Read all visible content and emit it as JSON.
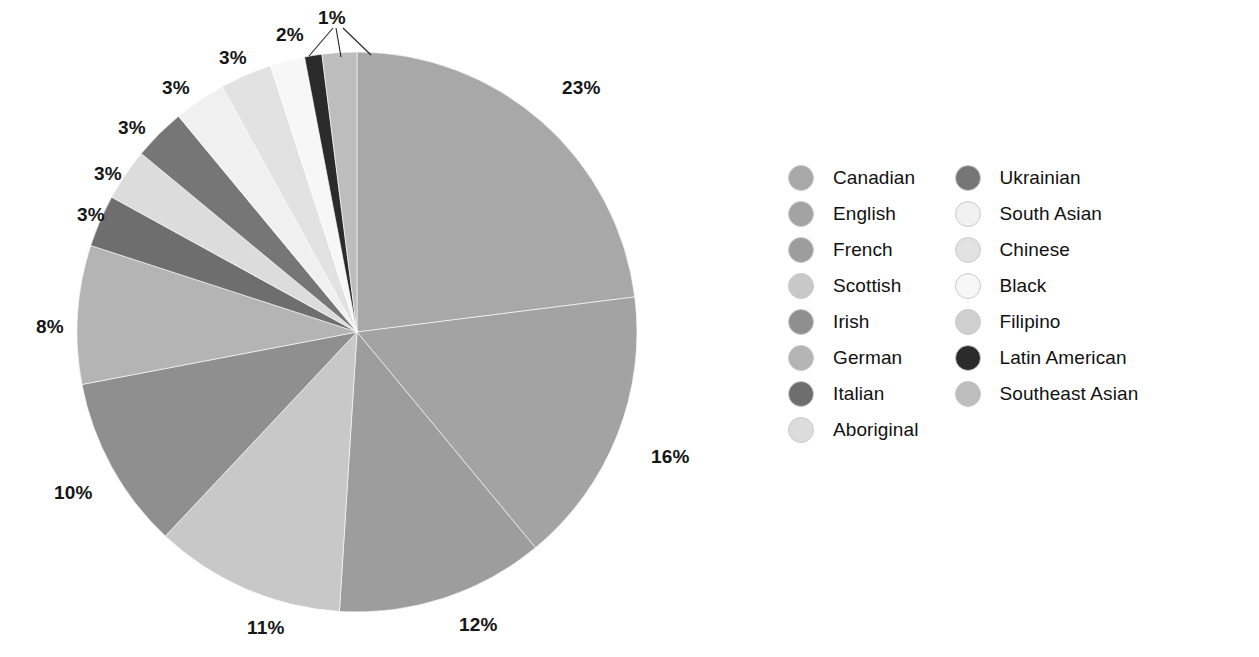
{
  "chart_data": {
    "type": "pie",
    "title": "",
    "subtitle": "",
    "xlabel": "",
    "ylabel": "",
    "legend_position": "right",
    "grid": false,
    "start_angle_deg": 0,
    "direction": "clockwise",
    "units": "percent",
    "categories": [
      "Canadian",
      "English",
      "French",
      "Scottish",
      "Irish",
      "German",
      "Italian",
      "Aboriginal",
      "Ukrainian",
      "South Asian",
      "Chinese",
      "Black",
      "Latin American",
      "Southeast Asian"
    ],
    "values": [
      23,
      16,
      12,
      11,
      10,
      8,
      3,
      3,
      3,
      3,
      3,
      2,
      1,
      2
    ],
    "labels": [
      "23%",
      "16%",
      "12%",
      "11%",
      "10%",
      "8%",
      "3%",
      "3%",
      "3%",
      "3%",
      "3%",
      "2%",
      "1%",
      "2%"
    ],
    "colors": [
      "#a8a8a8",
      "#a3a3a3",
      "#9d9d9d",
      "#c8c8c8",
      "#8f8f8f",
      "#b4b4b4",
      "#6e6e6e",
      "#dcdcdc",
      "#767676",
      "#f0f0f0",
      "#e2e2e2",
      "#f7f7f7",
      "#2b2b2b",
      "#bdbdbd"
    ],
    "slice_angles_deg": [
      {
        "name": "Canadian",
        "start": 0,
        "end": 82.8
      },
      {
        "name": "English",
        "start": 82.8,
        "end": 140.4
      },
      {
        "name": "French",
        "start": 140.4,
        "end": 183.6
      },
      {
        "name": "Scottish",
        "start": 183.6,
        "end": 223.2
      },
      {
        "name": "Irish",
        "start": 223.2,
        "end": 259.2
      },
      {
        "name": "German",
        "start": 259.2,
        "end": 288.0
      },
      {
        "name": "Italian",
        "start": 288.0,
        "end": 298.8
      },
      {
        "name": "Aboriginal",
        "start": 298.8,
        "end": 309.6
      },
      {
        "name": "Ukrainian",
        "start": 309.6,
        "end": 320.4
      },
      {
        "name": "South Asian",
        "start": 320.4,
        "end": 331.2
      },
      {
        "name": "Chinese",
        "start": 331.2,
        "end": 342.0
      },
      {
        "name": "Black",
        "start": 342.0,
        "end": 349.2
      },
      {
        "name": "Latin American",
        "start": 349.2,
        "end": 352.8
      },
      {
        "name": "Southeast Asian",
        "start": 352.8,
        "end": 360.0
      }
    ]
  },
  "pie": {
    "center_x": 357,
    "center_y": 332,
    "radius": 280,
    "percent_labels": [
      {
        "text": "23%",
        "x": 562,
        "y": 78,
        "slice": "Canadian"
      },
      {
        "text": "16%",
        "x": 651,
        "y": 447,
        "slice": "English"
      },
      {
        "text": "12%",
        "x": 459,
        "y": 615,
        "slice": "French"
      },
      {
        "text": "11%",
        "x": 247,
        "y": 618,
        "slice": "Scottish"
      },
      {
        "text": "10%",
        "x": 54,
        "y": 483,
        "slice": "Irish"
      },
      {
        "text": "8%",
        "x": 36,
        "y": 317,
        "slice": "German"
      },
      {
        "text": "3%",
        "x": 77,
        "y": 205,
        "slice": "Italian"
      },
      {
        "text": "3%",
        "x": 94,
        "y": 164,
        "slice": "Aboriginal"
      },
      {
        "text": "3%",
        "x": 118,
        "y": 118,
        "slice": "Ukrainian"
      },
      {
        "text": "3%",
        "x": 162,
        "y": 78,
        "slice": "South Asian"
      },
      {
        "text": "3%",
        "x": 219,
        "y": 48,
        "slice": "Chinese"
      },
      {
        "text": "2%",
        "x": 276,
        "y": 25,
        "slice": "Black"
      },
      {
        "text": "1%",
        "x": 318,
        "y": 8,
        "slice": "Latin American"
      }
    ],
    "leader_lines": [
      {
        "from_x": 333,
        "from_y": 28,
        "to_x": 309,
        "to_y": 56
      },
      {
        "from_x": 336,
        "from_y": 28,
        "to_x": 341,
        "to_y": 57
      },
      {
        "from_x": 343,
        "from_y": 28,
        "to_x": 371,
        "to_y": 55
      }
    ]
  },
  "legend": {
    "columns": [
      {
        "items": [
          {
            "label": "Canadian",
            "color": "#a8a8a8"
          },
          {
            "label": "English",
            "color": "#a3a3a3"
          },
          {
            "label": "French",
            "color": "#9d9d9d"
          },
          {
            "label": "Scottish",
            "color": "#c8c8c8"
          },
          {
            "label": "Irish",
            "color": "#8f8f8f"
          },
          {
            "label": "German",
            "color": "#b4b4b4"
          },
          {
            "label": "Italian",
            "color": "#6e6e6e"
          },
          {
            "label": "Aboriginal",
            "color": "#dcdcdc"
          }
        ]
      },
      {
        "items": [
          {
            "label": "Ukrainian",
            "color": "#767676"
          },
          {
            "label": "South Asian",
            "color": "#f0f0f0"
          },
          {
            "label": "Chinese",
            "color": "#e2e2e2"
          },
          {
            "label": "Black",
            "color": "#f7f7f7"
          },
          {
            "label": "Filipino",
            "color": "#cfcfcf"
          },
          {
            "label": "Latin American",
            "color": "#2b2b2b"
          },
          {
            "label": "Southeast Asian",
            "color": "#bdbdbd"
          }
        ]
      }
    ]
  }
}
